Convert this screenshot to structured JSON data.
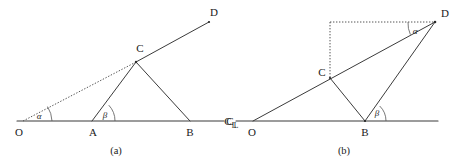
{
  "figure": {
    "background_color": "#ffffff",
    "line_color": "#3b3b3b",
    "dotted_color": "#555555",
    "text_color": "#1a1a1a",
    "panels": [
      {
        "id": "panel-a",
        "caption": "(a)",
        "points": [
          {
            "name": "O",
            "label": "O",
            "x": 23,
            "y": 121
          },
          {
            "name": "A",
            "label": "A",
            "x": 92,
            "y": 121
          },
          {
            "name": "B",
            "label": "B",
            "x": 190,
            "y": 121
          },
          {
            "name": "C",
            "label": "C",
            "x": 136,
            "y": 62
          },
          {
            "name": "D",
            "label": "D",
            "x": 209,
            "y": 22
          }
        ],
        "angles": [
          {
            "name": "alpha",
            "label": "α",
            "vertex": "O",
            "x": 38,
            "y": 116
          },
          {
            "name": "beta",
            "label": "β",
            "vertex": "A",
            "x": 104,
            "y": 115
          }
        ],
        "centerline_symbol": {
          "main": "C",
          "sub": "L",
          "x": 217,
          "y": 121
        },
        "solid_segments": [
          {
            "name": "baseline-O-to-CL",
            "from": [
              17,
              121
            ],
            "to": [
              224,
              121
            ]
          },
          {
            "name": "segment-C-to-A",
            "from": [
              136,
              62
            ],
            "to": [
              92,
              121
            ]
          },
          {
            "name": "segment-C-to-B",
            "from": [
              136,
              62
            ],
            "to": [
              190,
              121
            ]
          },
          {
            "name": "segment-C-to-D",
            "from": [
              136,
              62
            ],
            "to": [
              209,
              22
            ]
          }
        ],
        "dotted_segments": [
          {
            "name": "dotted-O-to-C",
            "from": [
              23,
              121
            ],
            "to": [
              136,
              62
            ]
          }
        ]
      },
      {
        "id": "panel-b",
        "caption": "(b)",
        "points": [
          {
            "name": "O",
            "label": "O",
            "x": 253,
            "y": 121
          },
          {
            "name": "B",
            "label": "B",
            "x": 365,
            "y": 121
          },
          {
            "name": "C",
            "label": "C",
            "x": 330,
            "y": 78
          },
          {
            "name": "D",
            "label": "D",
            "x": 435,
            "y": 22
          }
        ],
        "angles": [
          {
            "name": "alpha",
            "label": "α",
            "vertex": "D",
            "x": 416,
            "y": 33
          },
          {
            "name": "beta",
            "label": "β",
            "vertex": "B",
            "x": 377,
            "y": 114
          }
        ],
        "centerline_symbol": {
          "main": "C",
          "sub": "L",
          "x": 232,
          "y": 121
        },
        "solid_segments": [
          {
            "name": "baseline-CL-to-right",
            "from": [
              236,
              121
            ],
            "to": [
              438,
              121
            ]
          },
          {
            "name": "segment-O-to-D",
            "from": [
              253,
              121
            ],
            "to": [
              435,
              22
            ]
          },
          {
            "name": "segment-C-to-B",
            "from": [
              330,
              78
            ],
            "to": [
              365,
              121
            ]
          },
          {
            "name": "segment-B-to-D",
            "from": [
              365,
              121
            ],
            "to": [
              435,
              22
            ]
          }
        ],
        "dotted_segments": [
          {
            "name": "dotted-horizontal-to-D",
            "from": [
              330,
              22
            ],
            "to": [
              433,
              22
            ]
          },
          {
            "name": "dotted-vertical-C-to-top",
            "from": [
              330,
              22
            ],
            "to": [
              330,
              79
            ]
          }
        ]
      }
    ]
  }
}
